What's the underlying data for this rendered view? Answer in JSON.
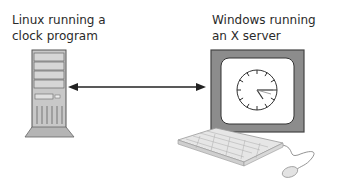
{
  "left": {
    "label_line1": "Linux running a",
    "label_line2": "clock program",
    "icon": "tower-computer-icon"
  },
  "right": {
    "label_line1": "Windows running",
    "label_line2": "an X server",
    "monitor_icon": "monitor-icon",
    "screen_content": "clock-icon",
    "keyboard_icon": "keyboard-icon",
    "mouse_icon": "mouse-icon"
  },
  "connection": {
    "type": "double-headed-arrow"
  },
  "colors": {
    "text": "#2a2a2a",
    "monitor_bezel": "#8c8c8c",
    "tower_body": "#c8c8c8",
    "stroke": "#333333"
  }
}
